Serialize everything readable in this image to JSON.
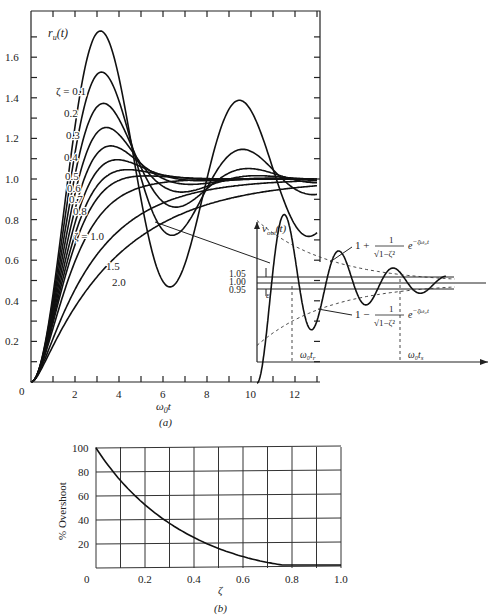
{
  "chart_data": [
    {
      "type": "line",
      "panel": "(a)",
      "title": "",
      "caption": "(a)",
      "xlabel": "ω0t",
      "ylabel": "r_u(t)",
      "xlim": [
        0,
        13
      ],
      "ylim": [
        0,
        1.8
      ],
      "xticks": [
        0,
        2,
        4,
        6,
        8,
        10,
        12
      ],
      "yticks": [
        0.2,
        0.4,
        0.6,
        0.8,
        1.0,
        1.2,
        1.4,
        1.6
      ],
      "xtick_labels": [
        "0",
        "2",
        "4",
        "6",
        "8",
        "10",
        "12"
      ],
      "ytick_labels": [
        "0.2",
        "0.4",
        "0.6",
        "0.8",
        "1.0",
        "1.2",
        "1.4",
        "1.6"
      ],
      "series": [
        {
          "name": "ζ = 0.1",
          "zeta": 0.1,
          "peak": 1.73
        },
        {
          "name": "0.2",
          "zeta": 0.2,
          "peak": 1.53
        },
        {
          "name": "0.3",
          "zeta": 0.3,
          "peak": 1.37
        },
        {
          "name": "0.4",
          "zeta": 0.4,
          "peak": 1.25
        },
        {
          "name": "0.5",
          "zeta": 0.5,
          "peak": 1.16
        },
        {
          "name": "0.6",
          "zeta": 0.6,
          "peak": 1.09
        },
        {
          "name": "0.7",
          "zeta": 0.7,
          "peak": 1.05
        },
        {
          "name": "0.8",
          "zeta": 0.8,
          "peak": 1.02
        },
        {
          "name": "ζ = 1.0",
          "zeta": 1.0,
          "peak": 1.0
        },
        {
          "name": "1.5",
          "zeta": 1.5,
          "peak": 1.0
        },
        {
          "name": "2.0",
          "zeta": 2.0,
          "peak": 1.0
        }
      ],
      "grid": false,
      "legend": "inline curve labels"
    },
    {
      "type": "line",
      "panel": "inset",
      "ylabel": "v_out(t)",
      "yticks": [
        0.95,
        1.0,
        1.05
      ],
      "ytick_labels": [
        "0.95",
        "1.00",
        "1.05"
      ],
      "annotations": [
        "ε",
        "1 + 1/√(1−ζ²) e^(−ζω0t)",
        "1 − 1/√(1−ζ²) e^(−ζω0t)",
        "ω0tr",
        "ω0ts"
      ]
    },
    {
      "type": "line",
      "panel": "(b)",
      "caption": "(b)",
      "xlabel": "ζ",
      "ylabel": "% Overshoot",
      "xlim": [
        0,
        1.0
      ],
      "ylim": [
        0,
        100
      ],
      "xticks": [
        0,
        0.2,
        0.4,
        0.6,
        0.8,
        1.0
      ],
      "yticks": [
        20,
        40,
        60,
        80,
        100
      ],
      "xtick_labels": [
        "0",
        "0.2",
        "0.4",
        "0.6",
        "0.8",
        "1.0"
      ],
      "ytick_labels": [
        "20",
        "40",
        "60",
        "80",
        "100"
      ],
      "x": [
        0,
        0.1,
        0.2,
        0.3,
        0.4,
        0.5,
        0.6,
        0.7,
        0.8,
        0.9,
        1.0
      ],
      "values": [
        100,
        73,
        53,
        37,
        25,
        16,
        9.5,
        4.6,
        1.5,
        0.2,
        0
      ],
      "grid": true
    }
  ],
  "labels": {
    "a_ylabel": "r",
    "a_ylabel_sub": "u",
    "a_ylabel_arg": "(t)",
    "a_xlabel": "ω",
    "a_xlabel_sub": "0",
    "a_xlabel_t": "t",
    "a_caption": "(a)",
    "b_ylabel": "% Overshoot",
    "b_xlabel": "ζ",
    "b_caption": "(b)",
    "origin": "0",
    "inset_ylabel": "v",
    "inset_ylabel_sub": "out",
    "inset_ylabel_arg": "(t)",
    "inset_epsilon": "ε",
    "inset_y105": "1.05",
    "inset_y100": "1.00",
    "inset_y095": "0.95",
    "inset_upper_1": "1 +",
    "inset_lower_1": "1 −",
    "inset_frac_num": "1",
    "inset_frac_den": "√1−ζ²",
    "inset_exp": "e",
    "inset_exp_pow": "−ζω₀t",
    "inset_tr": "ω₀t",
    "inset_tr_sub": "r",
    "inset_ts": "ω₀t",
    "inset_ts_sub": "s"
  }
}
